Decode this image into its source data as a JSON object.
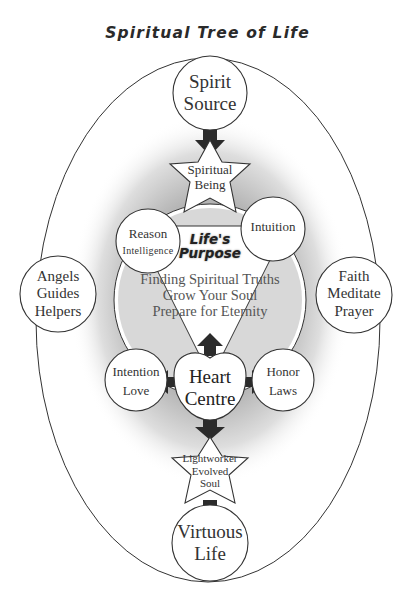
{
  "title": "Spiritual Tree of Life",
  "nodes": {
    "spirit_source": [
      "Spirit",
      "Source"
    ],
    "spiritual_being": [
      "Spiritual",
      "Being"
    ],
    "reason": [
      "Reason",
      "Intelligence"
    ],
    "intuition": "Intuition",
    "angels": [
      "Angels",
      "Guides",
      "Helpers"
    ],
    "faith": [
      "Faith",
      "Meditate",
      "Prayer"
    ],
    "intention": [
      "Intention",
      "Love"
    ],
    "honor": [
      "Honor",
      "Laws"
    ],
    "heart": [
      "Heart",
      "Centre"
    ],
    "lightworker": [
      "Lightworker",
      "Evolved",
      "Soul"
    ],
    "virtuous": [
      "Virtuous",
      "Life"
    ]
  },
  "purpose": {
    "heading": [
      "Life's",
      "Purpose"
    ],
    "lines": [
      "Finding Spiritual Truths",
      "Grow Your Soul",
      "Prepare for Eternity"
    ]
  },
  "colors": {
    "stroke": "#333333",
    "arrow": "#2b2b2b",
    "shade": "#9a9a9a",
    "fill": "#ffffff"
  }
}
